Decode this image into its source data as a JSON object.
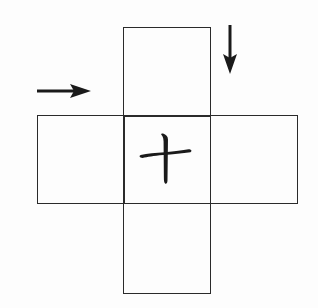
{
  "diagram": {
    "type": "cross-net",
    "cells": [
      {
        "id": "top",
        "x": 123,
        "y": 27,
        "w": 87,
        "h": 88,
        "label": ""
      },
      {
        "id": "left",
        "x": 37,
        "y": 115,
        "w": 86,
        "h": 88,
        "label": ""
      },
      {
        "id": "center",
        "x": 123,
        "y": 115,
        "w": 87,
        "h": 88,
        "label": "十"
      },
      {
        "id": "right",
        "x": 210,
        "y": 115,
        "w": 87,
        "h": 88,
        "label": ""
      },
      {
        "id": "bottom",
        "x": 123,
        "y": 203,
        "w": 87,
        "h": 90,
        "label": ""
      }
    ],
    "center_character": "十",
    "arrows": [
      {
        "id": "arrow-right",
        "direction": "right",
        "from": [
          37,
          91
        ],
        "to": [
          90,
          91
        ]
      },
      {
        "id": "arrow-down",
        "direction": "down",
        "from": [
          230,
          25
        ],
        "to": [
          230,
          72
        ]
      }
    ],
    "colors": {
      "line": "#2a2a2a",
      "background": "#fdfdfd",
      "ink": "#1a1a1a"
    }
  }
}
